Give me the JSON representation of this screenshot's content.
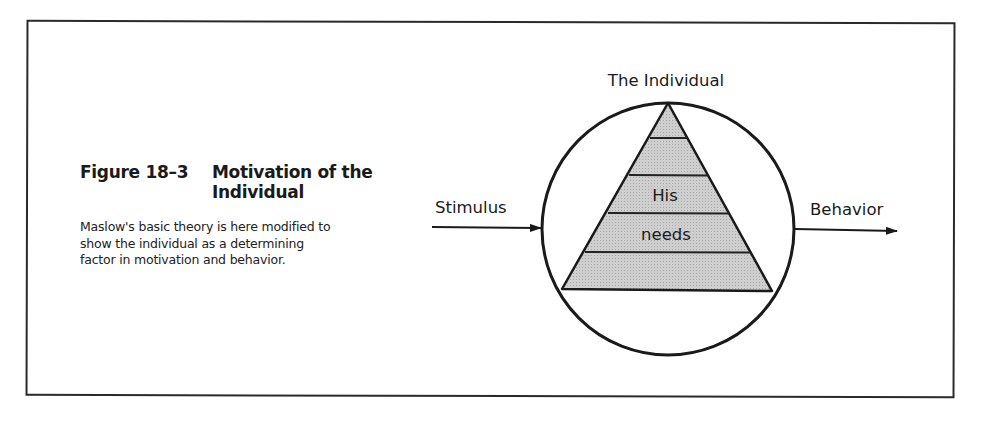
{
  "figure": {
    "number": "Figure 18–3",
    "title": "Motivation of the Individual",
    "description": "Maslow's basic theory is here modified to show the individual as a determining factor in motivation and behavior."
  },
  "diagram": {
    "top_label": "The Individual",
    "input_label": "Stimulus",
    "output_label": "Behavior",
    "pyramid_text_line1": "His",
    "pyramid_text_line2": "needs",
    "pyramid_levels": 5,
    "colors": {
      "pyramid_fill": "#c8c8c8",
      "stroke": "#1a1a1a",
      "background": "#ffffff"
    }
  }
}
